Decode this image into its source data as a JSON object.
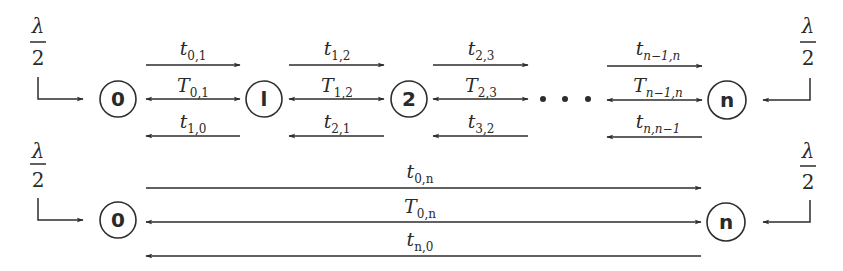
{
  "diagram": {
    "colors": {
      "stroke": "#2d2d2d",
      "text": "#2a2a2a",
      "background": "#ffffff"
    },
    "top_chain": {
      "nodes": [
        {
          "id": "0",
          "label": "0"
        },
        {
          "id": "1",
          "label": "l"
        },
        {
          "id": "2",
          "label": "2"
        },
        {
          "id": "n",
          "label": "n"
        }
      ],
      "ellipsis": "• • •",
      "inflow_left": {
        "numerator": "λ",
        "denominator": "2"
      },
      "inflow_right": {
        "numerator": "λ",
        "denominator": "2"
      },
      "edges": [
        {
          "forward": {
            "base": "t",
            "sub": "0,1"
          },
          "both": {
            "base": "T",
            "sub": "0,1"
          },
          "backward": {
            "base": "t",
            "sub": "1,0"
          }
        },
        {
          "forward": {
            "base": "t",
            "sub": "1,2"
          },
          "both": {
            "base": "T",
            "sub": "1,2"
          },
          "backward": {
            "base": "t",
            "sub": "2,1"
          }
        },
        {
          "forward": {
            "base": "t",
            "sub": "2,3"
          },
          "both": {
            "base": "T",
            "sub": "2,3"
          },
          "backward": {
            "base": "t",
            "sub": "3,2"
          }
        },
        {
          "forward": {
            "base": "t",
            "sub": "n−1,n"
          },
          "both": {
            "base": "T",
            "sub": "n−1,n"
          },
          "backward": {
            "base": "t",
            "sub": "n,n−1"
          }
        }
      ]
    },
    "bottom_chain": {
      "nodes": [
        {
          "id": "0",
          "label": "0"
        },
        {
          "id": "n",
          "label": "n"
        }
      ],
      "inflow_left": {
        "numerator": "λ",
        "denominator": "2"
      },
      "inflow_right": {
        "numerator": "λ",
        "denominator": "2"
      },
      "edge": {
        "forward": {
          "base": "t",
          "sub": "0,n"
        },
        "both": {
          "base": "T",
          "sub": "0,n"
        },
        "backward": {
          "base": "t",
          "sub": "n,0"
        }
      }
    }
  }
}
